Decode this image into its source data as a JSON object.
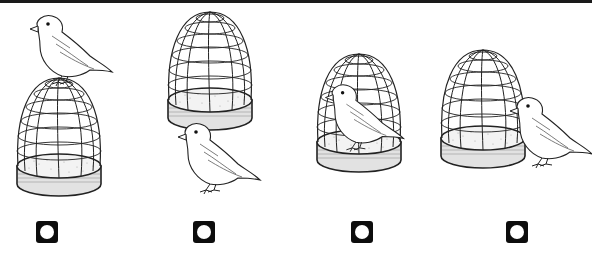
{
  "colors": {
    "line": "#222222",
    "base_fill": "#d9d9d9",
    "sand": "#bdbdbd",
    "marker": "#0d0d0d",
    "marker_dot": "#ffffff",
    "top_bar": "#1a1a1a"
  },
  "options": [
    {
      "id": "1",
      "scene": "bird on top of cage",
      "marker_x": 36
    },
    {
      "id": "2",
      "scene": "bird under cage",
      "marker_x": 193
    },
    {
      "id": "3",
      "scene": "bird inside cage",
      "marker_x": 351
    },
    {
      "id": "4",
      "scene": "bird beside cage",
      "marker_x": 506
    }
  ]
}
